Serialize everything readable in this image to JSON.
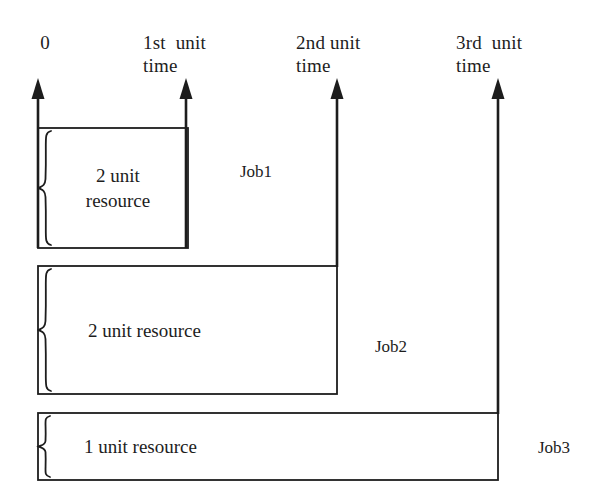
{
  "figure": {
    "stroke_color": "#1d1d1d",
    "background_color": "#ffffff"
  },
  "axis": {
    "name": "time-axis",
    "ticks": [
      {
        "id": "t0",
        "label_line1": "0",
        "label_line2": "",
        "x": 45
      },
      {
        "id": "t1",
        "label_line1": "1st  unit",
        "label_line2": "time",
        "x": 186
      },
      {
        "id": "t2",
        "label_line1": "2nd unit",
        "label_line2": "time",
        "x": 337
      },
      {
        "id": "t3",
        "label_line1": "3rd  unit",
        "label_line2": "time",
        "x": 498
      }
    ]
  },
  "jobs": [
    {
      "id": "job1",
      "name": "Job1",
      "resource_line1": "2 unit",
      "resource_line2": "resource",
      "resource_text": "2 unit resource",
      "resource_units": 2,
      "start_tick": "t0",
      "end_tick": "t1",
      "duration_units": 1
    },
    {
      "id": "job2",
      "name": "Job2",
      "resource_line1": "2 unit resource",
      "resource_line2": "",
      "resource_text": "2 unit resource",
      "resource_units": 2,
      "start_tick": "t0",
      "end_tick": "t2",
      "duration_units": 2
    },
    {
      "id": "job3",
      "name": "Job3",
      "resource_line1": "1 unit resource",
      "resource_line2": "",
      "resource_text": "1 unit resource",
      "resource_units": 1,
      "start_tick": "t0",
      "end_tick": "t3",
      "duration_units": 3
    }
  ]
}
